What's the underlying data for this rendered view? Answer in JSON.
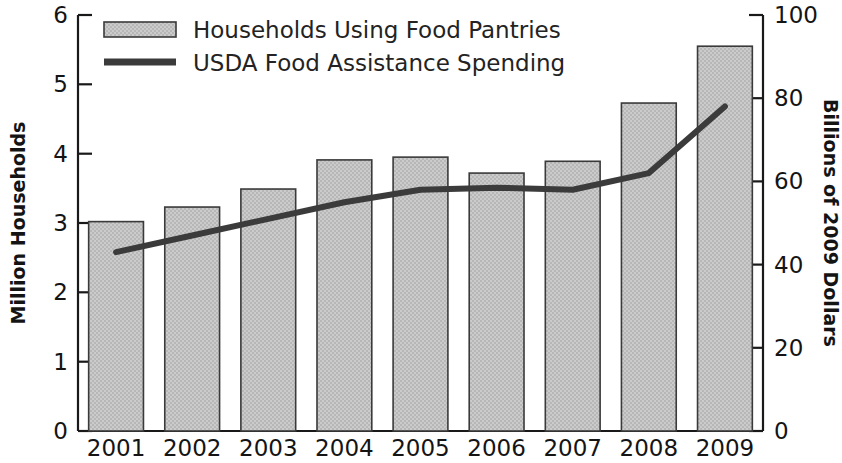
{
  "chart_data": {
    "type": "bar",
    "title": "",
    "subtitle": "",
    "categories": [
      "2001",
      "2002",
      "2003",
      "2004",
      "2005",
      "2006",
      "2007",
      "2008",
      "2009"
    ],
    "xlabel": "",
    "series": [
      {
        "name": "Households Using Food Pantries",
        "render": "bar",
        "axis": "left",
        "values": [
          3.02,
          3.23,
          3.49,
          3.91,
          3.95,
          3.72,
          3.89,
          4.73,
          5.55
        ]
      },
      {
        "name": "USDA Food Assistance Spending",
        "render": "line",
        "axis": "right",
        "values": [
          43,
          47,
          51,
          55,
          58,
          58.5,
          58,
          62,
          78
        ]
      }
    ],
    "left_axis": {
      "label": "Million Households",
      "ticks": [
        "0",
        "1",
        "2",
        "3",
        "4",
        "5",
        "6"
      ],
      "ylim": [
        0,
        6
      ]
    },
    "right_axis": {
      "label": "Billions of 2009 Dollars",
      "ticks": [
        "0",
        "20",
        "40",
        "60",
        "80",
        "100"
      ],
      "ylim": [
        0,
        100
      ]
    },
    "grid": false,
    "legend_position": "top-left",
    "colors": {
      "bar_fill": "#c8c8c8",
      "bar_edge": "#3a3a3a",
      "line": "#3b3b3b",
      "text": "#141414",
      "axis": "#191919",
      "background": "#ffffff"
    }
  }
}
